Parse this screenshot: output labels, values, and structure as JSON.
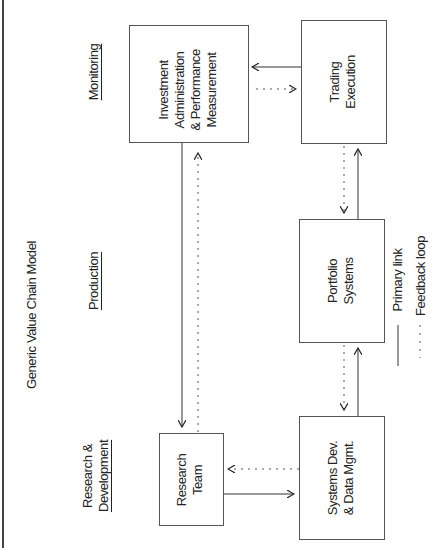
{
  "diagram": {
    "title": "Generic Value Chain Model",
    "stages": [
      {
        "id": "monitoring",
        "lines": [
          "Monitoring"
        ]
      },
      {
        "id": "production",
        "lines": [
          "Production"
        ]
      },
      {
        "id": "research-development",
        "lines": [
          "Research &",
          "Development"
        ]
      }
    ],
    "nodes": [
      {
        "id": "investment-admin",
        "lines": [
          "Investment",
          "Administration",
          "& Performance",
          "Measurement"
        ]
      },
      {
        "id": "trading-execution",
        "lines": [
          "Trading",
          "Execution"
        ]
      },
      {
        "id": "portfolio-systems",
        "lines": [
          "Portfolio",
          "Systems"
        ]
      },
      {
        "id": "systems-dev",
        "lines": [
          "Systems Dev.",
          "& Data Mgmt."
        ]
      },
      {
        "id": "research-team",
        "lines": [
          "Research",
          "Team"
        ]
      }
    ],
    "edges": [
      {
        "from": "trading-execution",
        "to": "investment-admin",
        "type": "primary"
      },
      {
        "from": "investment-admin",
        "to": "trading-execution",
        "type": "feedback"
      },
      {
        "from": "portfolio-systems",
        "to": "trading-execution",
        "type": "primary"
      },
      {
        "from": "trading-execution",
        "to": "portfolio-systems",
        "type": "feedback"
      },
      {
        "from": "systems-dev",
        "to": "portfolio-systems",
        "type": "primary"
      },
      {
        "from": "portfolio-systems",
        "to": "systems-dev",
        "type": "feedback"
      },
      {
        "from": "research-team",
        "to": "systems-dev",
        "type": "primary"
      },
      {
        "from": "systems-dev",
        "to": "research-team",
        "type": "feedback"
      },
      {
        "from": "investment-admin",
        "to": "research-team",
        "type": "primary"
      },
      {
        "from": "research-team",
        "to": "investment-admin",
        "type": "feedback"
      }
    ],
    "legend": {
      "primary": "Primary link",
      "feedback": "Feedback loop"
    }
  }
}
